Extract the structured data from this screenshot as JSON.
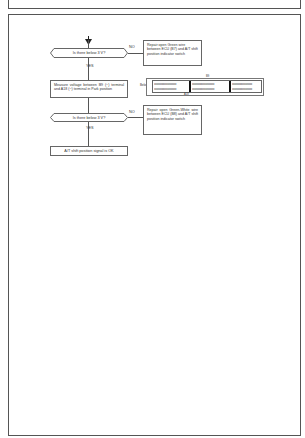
{
  "page": {
    "header_box": {
      "text": ""
    },
    "flowchart": {
      "start_arrow": "down-arrow",
      "decision_1": {
        "text": "Is there below 3 V?",
        "no_label": "NO",
        "yes_label": "YES",
        "no_action": "Repair open Green wire between ECU (B7) and A/T shift position indicator switch"
      },
      "process_1": {
        "text": "Measure voltage between B9 (−) terminal and A18 (−) terminal in Park position"
      },
      "connector": {
        "left_label": "Below",
        "top_label": "B9",
        "bottom_label": "A18",
        "row_pattern_a": "oooooooooo",
        "row_pattern_b": "ooooooooo",
        "segments": 3
      },
      "decision_2": {
        "text": "Is there below 3 V?",
        "no_label": "NO",
        "yes_label": "YES",
        "no_action": "Repair open Green-White wire between ECU (B8) and A/T shift position indicator switch"
      },
      "result": {
        "text": "A/T shift position signal is OK"
      }
    },
    "colors": {
      "line": "#555555",
      "text": "#333333",
      "background": "#ffffff"
    }
  }
}
